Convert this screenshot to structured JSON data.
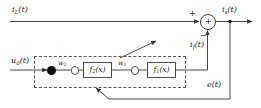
{
  "diagram": {
    "type": "block-diagram",
    "stroke_color": "#333333",
    "accent_color": "#000000",
    "background": "#ffffff"
  },
  "signals": {
    "load_current": {
      "symbol": "i",
      "subscript": "L",
      "arg": "(t)",
      "text": "iL(t)"
    },
    "source_current": {
      "symbol": "i",
      "subscript": "s",
      "arg": "(t)",
      "text": "is(t)"
    },
    "filter_current": {
      "symbol": "i",
      "subscript": "f",
      "arg": "(t)",
      "text": "if(t)"
    },
    "input_signal": {
      "symbol": "u",
      "subscript": "0",
      "arg": "(t)",
      "text": "u0(t)"
    },
    "error_signal": {
      "symbol": "e",
      "subscript": "",
      "arg": "(t)",
      "text": "e(t)"
    }
  },
  "summing_junction": {
    "operator": "+",
    "positive_sign": "+",
    "negative_sign": "−"
  },
  "network": {
    "weights": [
      {
        "symbol": "w",
        "subscript": "2"
      },
      {
        "symbol": "w",
        "subscript": "1"
      }
    ],
    "activation_blocks": [
      {
        "symbol": "f",
        "subscript": "2",
        "arg": "(x)"
      },
      {
        "symbol": "f",
        "subscript": "1",
        "arg": "(x)"
      }
    ],
    "nodes": [
      {
        "kind": "input-node",
        "style": "filled"
      },
      {
        "kind": "hidden-node",
        "style": "open"
      },
      {
        "kind": "hidden-node-2",
        "style": "open"
      }
    ],
    "boundary": {
      "style": "dashed",
      "label": ""
    }
  },
  "annotations": {
    "pointer": {
      "kind": "arrow",
      "label": ""
    }
  }
}
